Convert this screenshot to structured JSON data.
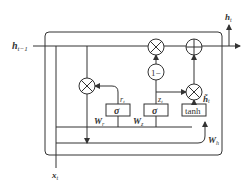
{
  "diagram": {
    "type": "GRU cell",
    "inputs": {
      "hidden_prev": "h",
      "hidden_prev_sub": "t−1",
      "input": "x",
      "input_sub": "t"
    },
    "output": {
      "hidden": "h",
      "hidden_sub": "t"
    },
    "gates": {
      "reset": {
        "activation": "σ",
        "weight": "W",
        "weight_sub": "r",
        "output": "r",
        "output_sub": "t"
      },
      "update": {
        "activation": "σ",
        "weight": "W",
        "weight_sub": "z",
        "output": "z",
        "output_sub": "t"
      },
      "candidate": {
        "activation": "tanh",
        "weight": "W",
        "weight_sub": "h",
        "output": "h̃",
        "output_sub": "t"
      }
    },
    "operators": {
      "multiply": "×",
      "add": "+",
      "one_minus": "1−"
    }
  }
}
